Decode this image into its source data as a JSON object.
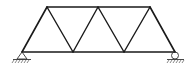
{
  "diagram": {
    "type": "truss",
    "nodes": {
      "bottom": [
        [
          22,
          52
        ],
        [
          73,
          52
        ],
        [
          124,
          52
        ],
        [
          175,
          52
        ]
      ],
      "top": [
        [
          47,
          7
        ],
        [
          98,
          7
        ],
        [
          150,
          7
        ]
      ]
    },
    "supports": {
      "left": "pin",
      "right": "roller"
    },
    "colors": {
      "line": "#1a1a1a",
      "background": "#ffffff"
    }
  }
}
